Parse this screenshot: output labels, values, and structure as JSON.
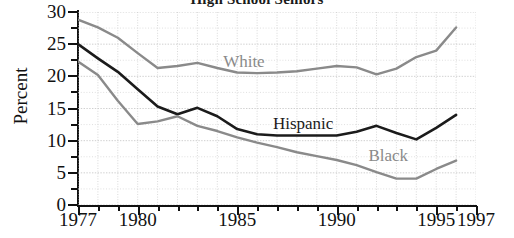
{
  "chart_data": {
    "type": "line",
    "title": "High School Seniors",
    "xlabel": "",
    "ylabel": "Percent",
    "xlim": [
      1977,
      1997
    ],
    "ylim": [
      0,
      30
    ],
    "yticks": [
      0,
      5,
      10,
      15,
      20,
      25,
      30
    ],
    "ytick_labels": [
      "0",
      "5",
      "10",
      "15",
      "20",
      "25",
      "30"
    ],
    "xticks": [
      1977,
      1980,
      1985,
      1990,
      1995,
      1997
    ],
    "xtick_labels": [
      "1977",
      "1980",
      "1985",
      "1990",
      "1995",
      "1997"
    ],
    "grid": true,
    "legend_position": "inline-annotations",
    "x": [
      1977,
      1978,
      1979,
      1980,
      1981,
      1982,
      1983,
      1984,
      1985,
      1986,
      1987,
      1988,
      1989,
      1990,
      1991,
      1992,
      1993,
      1994,
      1995,
      1996
    ],
    "series": [
      {
        "name": "White",
        "color": "#8a8a8a",
        "values": [
          28.8,
          27.6,
          26.0,
          23.6,
          21.3,
          21.6,
          22.1,
          21.3,
          20.6,
          20.5,
          20.6,
          20.8,
          21.2,
          21.6,
          21.4,
          20.3,
          21.2,
          23.0,
          24.0,
          27.6
        ]
      },
      {
        "name": "Hispanic",
        "color": "#1b1b1b",
        "values": [
          25.0,
          22.8,
          20.7,
          18.0,
          15.3,
          14.1,
          15.1,
          13.8,
          11.8,
          11.0,
          10.8,
          10.8,
          10.8,
          10.8,
          11.4,
          12.3,
          11.2,
          10.2,
          12.0,
          14.0
        ]
      },
      {
        "name": "Black",
        "color": "#8a8a8a",
        "values": [
          22.3,
          20.2,
          16.2,
          12.6,
          13.0,
          13.8,
          12.3,
          11.5,
          10.5,
          9.7,
          9.0,
          8.2,
          7.6,
          7.0,
          6.2,
          5.1,
          4.1,
          4.1,
          5.6,
          6.9
        ]
      }
    ],
    "annotations": [
      {
        "text": "White",
        "series": "White"
      },
      {
        "text": "Hispanic",
        "series": "Hispanic"
      },
      {
        "text": "Black",
        "series": "Black"
      }
    ]
  }
}
